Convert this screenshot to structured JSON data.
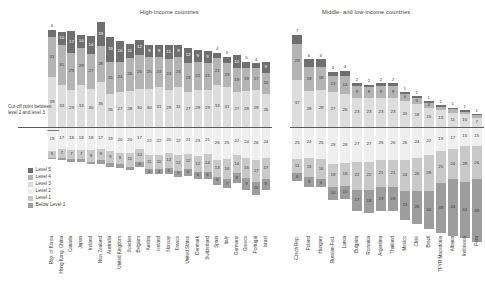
{
  "panels": {
    "high": {
      "title": "High-income countries"
    },
    "mid": {
      "title": "Middle- and low-income countries"
    }
  },
  "annotation": {
    "cutoff_note": "Cut-off point between level 2 and level 3"
  },
  "legend": {
    "items": [
      {
        "label": "Level 5",
        "color": "#6f6f6f"
      },
      {
        "label": "Level 4",
        "color": "#b4b4b4"
      },
      {
        "label": "Level 3",
        "color": "#dddddd"
      },
      {
        "label": "Level 2",
        "color": "#efefef"
      },
      {
        "label": "Level 1",
        "color": "#c9c9c9"
      },
      {
        "label": "Below Level 1",
        "color": "#9d9d9d"
      }
    ]
  },
  "chart_data": {
    "type": "bar",
    "title": "",
    "subtitle": "",
    "xlabel": "",
    "ylabel": "",
    "orientation": "vertical-diverging-stacked",
    "grid": false,
    "legend_position": "bottom-left",
    "cutoff_label": "Cut-off point between level 2 and level 3",
    "level_order_above": [
      "Level 3",
      "Level 4",
      "Level 5"
    ],
    "level_order_below": [
      "Level 2",
      "Level 1",
      "Below Level 1"
    ],
    "panels": [
      {
        "name": "High-income countries",
        "categories": [
          "Rep. of Korea",
          "Hong Kong, China",
          "Canada",
          "Japan",
          "Ireland",
          "New Zealand",
          "Australia",
          "United Kingdom",
          "Sweden",
          "Belgium",
          "Austria",
          "Iceland",
          "Norway",
          "France",
          "United States",
          "Denmark",
          "Switzerland",
          "Spain",
          "Italy",
          "Germany",
          "Greece",
          "Portugal",
          "Israel"
        ],
        "series": [
          {
            "name": "Level 5",
            "values": [
              6,
              10,
              17,
              10,
              14,
              19,
              19,
              16,
              11,
              12,
              9,
              9,
              11,
              9,
              12,
              9,
              9,
              4,
              5,
              10,
              5,
              4,
              9
            ]
          },
          {
            "name": "Level 4",
            "values": [
              31,
              31,
              29,
              29,
              27,
              28,
              25,
              24,
              26,
              26,
              25,
              24,
              24,
              24,
              23,
              22,
              21,
              21,
              19,
              19,
              18,
              17,
              16
            ]
          },
          {
            "name": "Level 3",
            "values": [
              39,
              33,
              29,
              33,
              30,
              35,
              26,
              27,
              28,
              30,
              30,
              31,
              29,
              31,
              27,
              29,
              29,
              33,
              31,
              27,
              28,
              29,
              26
            ]
          },
          {
            "name": "Level 2",
            "values": [
              19,
              17,
              18,
              18,
              18,
              17,
              19,
              20,
              20,
              17,
              22,
              22,
              20,
              22,
              21,
              23,
              21,
              26,
              25,
              22,
              24,
              26,
              24
            ]
          },
          {
            "name": "Level 1",
            "values": [
              5,
              7,
              7,
              7,
              9,
              9,
              9,
              9,
              11,
              10,
              11,
              11,
              12,
              12,
              12,
              12,
              14,
              13,
              16,
              14,
              16,
              17,
              17
            ]
          },
          {
            "name": "Below Level 1",
            "values": [
              1,
              2,
              2,
              2,
              2,
              3,
              3,
              3,
              3,
              4,
              4,
              4,
              5,
              5,
              5,
              6,
              6,
              6,
              7,
              8,
              9,
              10,
              8
            ]
          }
        ]
      },
      {
        "name": "Middle- and low-income countries",
        "categories": [
          "Czech Rep.",
          "Poland",
          "Hungary",
          "Russian Fed.",
          "Latvia",
          "Bulgaria",
          "Romania",
          "Argentina",
          "Thailand",
          "Mexico",
          "Chile",
          "Brazil",
          "TFYR Macedonia",
          "Albania",
          "Indonesia",
          "Peru"
        ],
        "series": [
          {
            "name": "Level 5",
            "values": [
              7,
              6,
              6,
              3,
              4,
              2,
              2,
              2,
              2,
              1,
              1,
              1,
              1,
              1,
              1,
              1
            ]
          },
          {
            "name": "Level 4",
            "values": [
              28,
              19,
              18,
              13,
              14,
              9,
              8,
              9,
              9,
              6,
              5,
              4,
              3,
              3,
              2,
              2
            ]
          },
          {
            "name": "Level 3",
            "values": [
              37,
              28,
              29,
              27,
              26,
              23,
              23,
              23,
              23,
              20,
              18,
              15,
              13,
              11,
              10,
              7
            ]
          },
          {
            "name": "Level 2",
            "values": [
              25,
              24,
              25,
              29,
              28,
              27,
              27,
              26,
              26,
              26,
              24,
              22,
              19,
              17,
              15,
              15
            ]
          },
          {
            "name": "Level 1",
            "values": [
              11,
              15,
              16,
              18,
              18,
              22,
              22,
              21,
              21,
              24,
              26,
              28,
              25,
              24,
              28,
              26
            ]
          },
          {
            "name": "Below Level 1",
            "values": [
              6,
              8,
              6,
              10,
              10,
              17,
              18,
              19,
              19,
              23,
              26,
              30,
              39,
              44,
              44,
              49
            ]
          }
        ]
      }
    ]
  }
}
